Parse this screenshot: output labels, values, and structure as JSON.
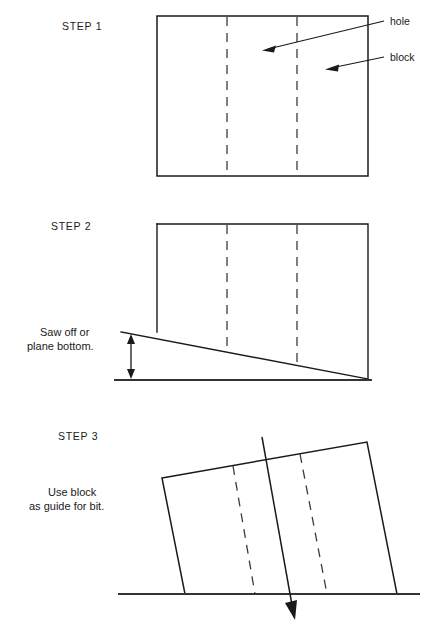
{
  "figure": {
    "kind": "technical-instruction-diagram",
    "background_color": "#ffffff",
    "line_color": "#1a1a1a",
    "width": 432,
    "height": 634
  },
  "steps": [
    {
      "id": "step-1",
      "label": "STEP 1",
      "caption_lines": [],
      "callouts": [
        {
          "id": "hole",
          "label": "hole"
        },
        {
          "id": "block",
          "label": "block"
        }
      ]
    },
    {
      "id": "step-2",
      "label": "STEP 2",
      "caption_lines": [
        "Saw off or",
        "plane bottom."
      ],
      "callouts": []
    },
    {
      "id": "step-3",
      "label": "STEP 3",
      "caption_lines": [
        "Use block",
        "as guide for bit."
      ],
      "callouts": []
    }
  ],
  "geometry": {
    "step1": {
      "block_rect": {
        "x": 157,
        "y": 16,
        "width": 211,
        "height": 160
      },
      "dashed_hole_x": [
        227,
        297
      ],
      "hole_leader": {
        "x1": 384,
        "y1": 21,
        "x2": 264,
        "y2": 50
      },
      "block_leader": {
        "x1": 384,
        "y1": 57,
        "x2": 327,
        "y2": 69
      },
      "hole_label_pos": {
        "x": 390,
        "y": 25
      },
      "block_label_pos": {
        "x": 390,
        "y": 61
      },
      "step_label_pos": {
        "x": 62,
        "y": 30
      }
    },
    "step2": {
      "block_rect": {
        "x": 157,
        "y": 224,
        "width": 211,
        "height": 156
      },
      "dashed_hole_x": [
        227,
        297
      ],
      "cut_line": {
        "x1": 121,
        "y1": 332,
        "x2": 368,
        "y2": 379
      },
      "ground_line": {
        "x1": 114,
        "y1": 380,
        "x2": 372,
        "y2": 380
      },
      "dimension_arrow_x": 131,
      "dimension_top_y": 336,
      "dimension_bottom_y": 379,
      "step_label_pos": {
        "x": 51,
        "y": 230
      },
      "caption_pos": {
        "x": 40,
        "y": 336
      }
    },
    "step3": {
      "block_corners": [
        {
          "x": 162,
          "y": 478
        },
        {
          "x": 367,
          "y": 442
        },
        {
          "x": 397,
          "y": 594
        },
        {
          "x": 185,
          "y": 594
        }
      ],
      "dashed_holes": [
        {
          "x1": 233,
          "y1": 466,
          "x2": 255,
          "y2": 594
        },
        {
          "x1": 300,
          "y1": 454,
          "x2": 327,
          "y2": 594
        }
      ],
      "ground_line": {
        "x1": 118,
        "y1": 594,
        "x2": 420,
        "y2": 594
      },
      "bit_line": {
        "x1": 262,
        "y1": 437,
        "x2": 294,
        "y2": 616
      },
      "step_label_pos": {
        "x": 58,
        "y": 440
      },
      "caption_pos": {
        "x": 43,
        "y": 496
      }
    }
  }
}
